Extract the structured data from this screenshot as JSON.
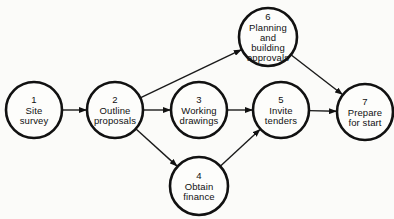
{
  "diagram": {
    "type": "network",
    "colors": {
      "stroke": "#111111",
      "background": "#fbfbf9",
      "node_fill": "#fdfdfb"
    },
    "nodes": [
      {
        "id": "1",
        "number": "1",
        "lines": [
          "Site",
          "survey"
        ],
        "cx": 34,
        "cy": 110,
        "r": 28
      },
      {
        "id": "2",
        "number": "2",
        "lines": [
          "Outline",
          "proposals"
        ],
        "cx": 115,
        "cy": 110,
        "r": 28
      },
      {
        "id": "3",
        "number": "3",
        "lines": [
          "Working",
          "drawings"
        ],
        "cx": 199,
        "cy": 110,
        "r": 28
      },
      {
        "id": "4",
        "number": "4",
        "lines": [
          "Obtain",
          "finance"
        ],
        "cx": 199,
        "cy": 186,
        "r": 29
      },
      {
        "id": "5",
        "number": "5",
        "lines": [
          "Invite",
          "tenders"
        ],
        "cx": 281,
        "cy": 110,
        "r": 28
      },
      {
        "id": "6",
        "number": "6",
        "lines": [
          "Planning",
          "and",
          "building",
          "approvals"
        ],
        "cx": 268,
        "cy": 37,
        "r": 29
      },
      {
        "id": "7",
        "number": "7",
        "lines": [
          "Prepare",
          "for start"
        ],
        "cx": 365,
        "cy": 112,
        "r": 28
      }
    ],
    "edges": [
      {
        "from": "1",
        "to": "2"
      },
      {
        "from": "2",
        "to": "3"
      },
      {
        "from": "2",
        "to": "6"
      },
      {
        "from": "2",
        "to": "4"
      },
      {
        "from": "3",
        "to": "5"
      },
      {
        "from": "4",
        "to": "5"
      },
      {
        "from": "5",
        "to": "7"
      },
      {
        "from": "6",
        "to": "7"
      }
    ]
  }
}
